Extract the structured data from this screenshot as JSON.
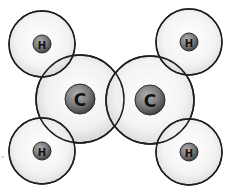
{
  "diagram": {
    "colors": {
      "shell_stroke": "#1e1e1e",
      "shell_fill_center": "#ffffff",
      "shell_fill_edge": "#d6d6d6",
      "nucleus_light": "#9a9a9a",
      "nucleus_dark": "#4a4a4a",
      "label": "#111111"
    },
    "atoms": [
      {
        "id": "h1",
        "symbol": "H",
        "cx": 42,
        "cy": 44,
        "shell_r": 33,
        "nucleus_r": 9
      },
      {
        "id": "h2",
        "symbol": "H",
        "cx": 189,
        "cy": 42,
        "shell_r": 33,
        "nucleus_r": 9
      },
      {
        "id": "c1",
        "symbol": "C",
        "cx": 80,
        "cy": 99,
        "shell_r": 44,
        "nucleus_r": 15
      },
      {
        "id": "c2",
        "symbol": "C",
        "cx": 150,
        "cy": 100,
        "shell_r": 44,
        "nucleus_r": 15
      },
      {
        "id": "h3",
        "symbol": "H",
        "cx": 42,
        "cy": 151,
        "shell_r": 33,
        "nucleus_r": 9
      },
      {
        "id": "h4",
        "symbol": "H",
        "cx": 189,
        "cy": 152,
        "shell_r": 33,
        "nucleus_r": 9
      }
    ],
    "labels": {
      "h1": "H",
      "h2": "H",
      "c1": "C",
      "c2": "C",
      "h3": "H",
      "h4": "H"
    }
  }
}
